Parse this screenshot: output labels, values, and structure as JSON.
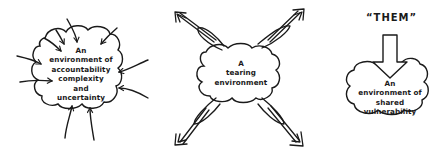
{
  "diagrams": [
    {
      "id": "accountability",
      "label_lines": [
        "An",
        "environment of",
        "accountability",
        "complexity",
        "and",
        "uncertainty"
      ],
      "arrow_direction": "inward",
      "arrow_count": 10
    },
    {
      "id": "tearing",
      "label_lines": [
        "A",
        "tearing",
        "environment"
      ],
      "arrow_direction": "outward",
      "arrow_count": 4
    },
    {
      "id": "shared-vulnerability",
      "header": "“THEM”",
      "label_lines": [
        "An",
        "environment of",
        "shared",
        "vulnerability"
      ],
      "arrow_direction": "down-into-cloud",
      "arrow_count": 1
    }
  ],
  "colors": {
    "ink": "#1a1a1a",
    "background": "#ffffff"
  }
}
